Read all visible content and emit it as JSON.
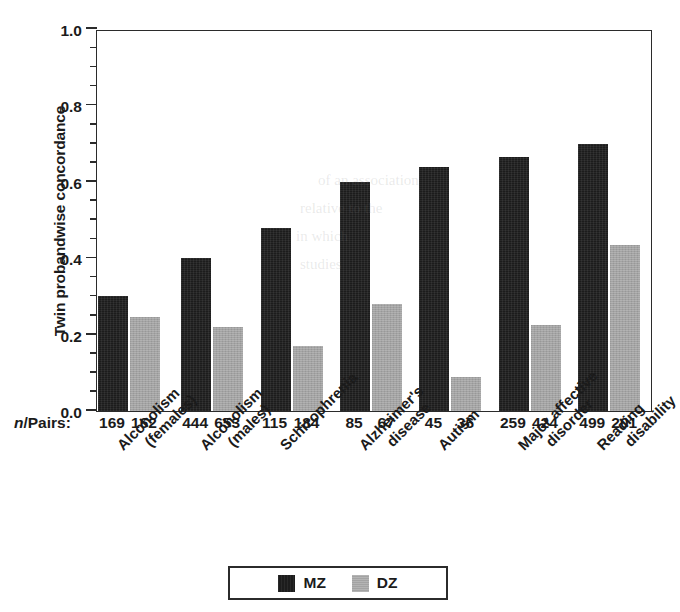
{
  "chart_data": {
    "type": "bar",
    "title": "",
    "xlabel": "",
    "ylabel": "Twin probandwise concordance",
    "ylim": [
      0.0,
      1.0
    ],
    "ytick_labels": [
      "0.0",
      "0.2",
      "0.4",
      "0.6",
      "0.8",
      "1.0"
    ],
    "ytick_values": [
      0.0,
      0.2,
      0.4,
      0.6,
      0.8,
      1.0
    ],
    "minor_tick_interval": 0.05,
    "grid": false,
    "legend_position": "bottom-center",
    "categories": [
      "Alcoholism (females)",
      "Alcoholism (males)",
      "Schizophrenia",
      "Alzheimer's disease",
      "Autism",
      "Major affective disorder",
      "Reading disability"
    ],
    "category_lines": [
      [
        "Alcoholism",
        "(females)"
      ],
      [
        "Alcoholism",
        "(males)"
      ],
      [
        "Schizophrenia",
        ""
      ],
      [
        "Alzheimer's",
        "disease"
      ],
      [
        "Autism",
        ""
      ],
      [
        "Major affective",
        "disorder"
      ],
      [
        "Reading",
        "disability"
      ]
    ],
    "series": [
      {
        "name": "MZ",
        "color": "#1c1c1c",
        "values": [
          0.3,
          0.4,
          0.48,
          0.6,
          0.64,
          0.665,
          0.7
        ]
      },
      {
        "name": "DZ",
        "color": "#a3a3a3",
        "values": [
          0.245,
          0.22,
          0.17,
          0.28,
          0.09,
          0.225,
          0.435
        ]
      }
    ],
    "npairs_label": "n/Pairs:",
    "npairs_label_italic_part": "n",
    "npairs_label_rest": "/Pairs:",
    "npairs": [
      {
        "mz": "169",
        "dz": "162"
      },
      {
        "mz": "444",
        "dz": "653"
      },
      {
        "mz": "115",
        "dz": "184"
      },
      {
        "mz": "85",
        "dz": "67"
      },
      {
        "mz": "45",
        "dz": "36"
      },
      {
        "mz": "259",
        "dz": "424"
      },
      {
        "mz": "499",
        "dz": "201"
      }
    ]
  },
  "legend": {
    "items": [
      {
        "label": "MZ",
        "color": "#1c1c1c"
      },
      {
        "label": "DZ",
        "color": "#a3a3a3"
      }
    ]
  },
  "colors": {
    "mz": "#1c1c1c",
    "dz": "#a3a3a3",
    "axis": "#2b2b2b",
    "text": "#1b1b1b",
    "background": "#ffffff"
  }
}
